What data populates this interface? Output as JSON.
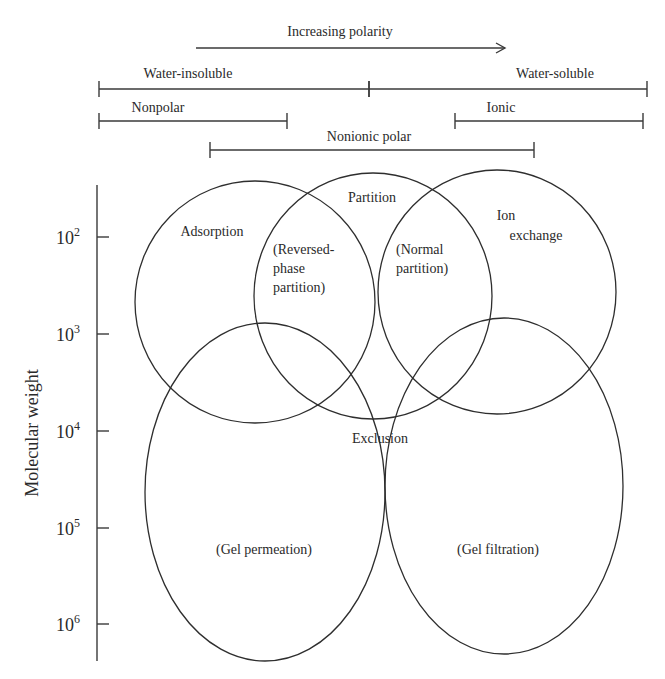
{
  "header": {
    "polarity_arrow": {
      "label": "Increasing polarity",
      "x1": 196,
      "x2": 505,
      "y": 48,
      "label_x": 340,
      "label_y": 36
    }
  },
  "ranges": [
    {
      "id": "water-insoluble",
      "label": "Water-insoluble",
      "x1": 99,
      "x2": 369,
      "y": 89,
      "label_x": 188,
      "label_y": 78
    },
    {
      "id": "water-soluble",
      "label": "Water-soluble",
      "x1": 369,
      "x2": 647,
      "y": 89,
      "label_x": 555,
      "label_y": 78
    },
    {
      "id": "nonpolar",
      "label": "Nonpolar",
      "x1": 99,
      "x2": 287,
      "y": 121,
      "label_x": 158,
      "label_y": 112
    },
    {
      "id": "ionic",
      "label": "Ionic",
      "x1": 455,
      "x2": 643,
      "y": 121,
      "label_x": 501,
      "label_y": 112
    },
    {
      "id": "nonionic-polar",
      "label": "Nonionic polar",
      "x1": 210,
      "x2": 534,
      "y": 150,
      "label_x": 369,
      "label_y": 141
    }
  ],
  "axis": {
    "label": "Molecular weight",
    "x": 97,
    "y1": 185,
    "y2": 661,
    "ticks": [
      {
        "base": "10",
        "exp": "2",
        "y": 237
      },
      {
        "base": "10",
        "exp": "3",
        "y": 334
      },
      {
        "base": "10",
        "exp": "4",
        "y": 431
      },
      {
        "base": "10",
        "exp": "5",
        "y": 528
      },
      {
        "base": "10",
        "exp": "6",
        "y": 624
      }
    ]
  },
  "regions": [
    {
      "id": "adsorption",
      "shape": "circle",
      "cx": 255,
      "cy": 302,
      "rx": 120,
      "ry": 121,
      "labels": [
        {
          "text": "Adsorption",
          "x": 212,
          "y": 236
        }
      ]
    },
    {
      "id": "partition",
      "shape": "circle",
      "cx": 373,
      "cy": 296,
      "rx": 119,
      "ry": 123,
      "labels": [
        {
          "text": "Partition",
          "x": 372,
          "y": 202
        }
      ]
    },
    {
      "id": "ion-exchange",
      "shape": "circle",
      "cx": 497,
      "cy": 292,
      "rx": 119,
      "ry": 122,
      "labels": [
        {
          "text": "Ion",
          "x": 506,
          "y": 220
        },
        {
          "text": "exchange",
          "x": 536,
          "y": 240
        }
      ]
    },
    {
      "id": "gel-permeation",
      "shape": "ellipse",
      "cx": 265,
      "cy": 492,
      "rx": 120,
      "ry": 169,
      "labels": [
        {
          "text": "(Gel permeation)",
          "x": 264,
          "y": 554
        }
      ]
    },
    {
      "id": "gel-filtration",
      "shape": "ellipse",
      "cx": 504,
      "cy": 486,
      "rx": 119,
      "ry": 168,
      "labels": [
        {
          "text": "(Gel filtration)",
          "x": 498,
          "y": 554
        }
      ]
    }
  ],
  "sub_labels": [
    {
      "id": "reversed-phase-partition",
      "lines": [
        "(Reversed-",
        "phase",
        "partition)"
      ],
      "x": 273,
      "y": 254,
      "line_height": 19
    },
    {
      "id": "normal-partition",
      "lines": [
        "(Normal",
        "partition)"
      ],
      "x": 396,
      "y": 254,
      "line_height": 19
    },
    {
      "id": "exclusion",
      "lines": [
        "Exclusion"
      ],
      "x": 352,
      "y": 443,
      "line_height": 19
    }
  ]
}
